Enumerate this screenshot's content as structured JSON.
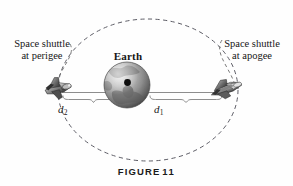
{
  "figure": {
    "caption_word": "FIGURE",
    "caption_number": "11",
    "alt": "Elliptical orbit of a space shuttle around Earth showing perigee and apogee"
  },
  "labels": {
    "perigee_line1": "Space shuttle",
    "perigee_line2": "at perigee",
    "apogee_line1": "Space shuttle",
    "apogee_line2": "at apogee",
    "earth": "Earth",
    "distance_left_symbol": "d",
    "distance_left_subscript": "2",
    "distance_right_symbol": "d",
    "distance_right_subscript": "1"
  },
  "colors": {
    "orbit_dash": "#5d5d66",
    "axis_line": "#8a8a8a",
    "brace_line": "#8e8e8e",
    "earth_dark": "#3a3a3a",
    "earth_mid": "#8d8d8d",
    "earth_light": "#d2d2d2",
    "focus_dot": "#0d0d0d",
    "shuttle_dark": "#2e2e2e",
    "shuttle_mid": "#8b8b8b",
    "shuttle_light": "#d8d8d8",
    "text": "#161616",
    "background": "#fefefe"
  },
  "geometry": {
    "orbit_center_x": 148,
    "orbit_center_y": 90,
    "orbit_radius_x": 90,
    "orbit_radius_y": 71,
    "earth_center_x": 127,
    "earth_center_y": 85,
    "earth_radius": 23,
    "focus_x": 127,
    "focus_y": 83,
    "axis_y": 92,
    "axis_x_start": 62,
    "axis_x_end": 228,
    "brace_left_start": 63,
    "brace_left_end": 124,
    "brace_right_start": 150,
    "brace_right_end": 222
  }
}
